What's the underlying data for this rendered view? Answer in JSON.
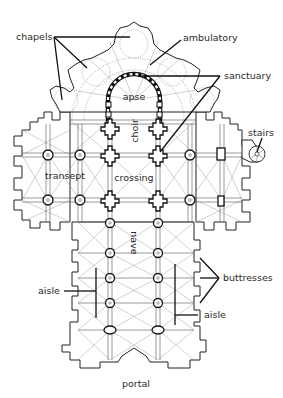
{
  "diagram": {
    "type": "cathedral-floor-plan",
    "background": "#ffffff",
    "line_color": "#222222",
    "labels": {
      "chapels": "chapels",
      "ambulatory": "ambulatory",
      "sanctuary": "sanctuary",
      "apse": "apse",
      "choir": "choir",
      "stairs": "stairs",
      "transept": "transept",
      "crossing": "crossing",
      "nave": "nave",
      "buttresses": "buttresses",
      "aisle_left": "aisle",
      "aisle_right": "aisle",
      "portal": "portal"
    }
  }
}
